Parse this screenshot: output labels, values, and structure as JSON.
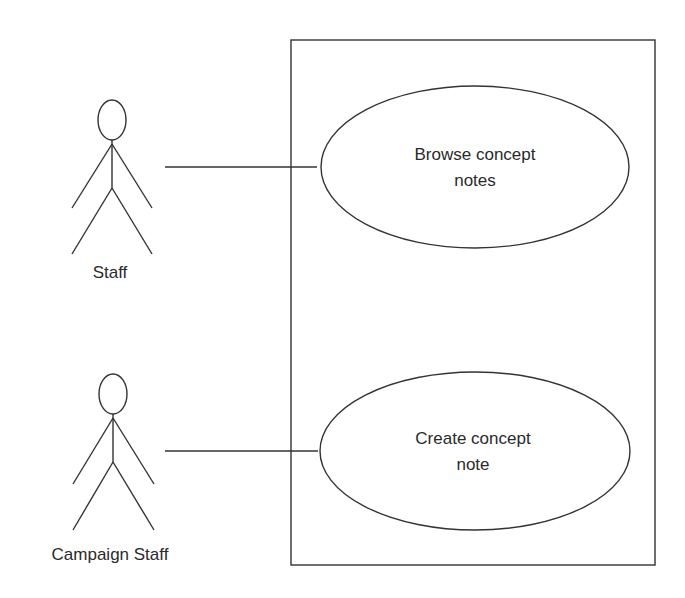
{
  "diagram": {
    "type": "uml-use-case",
    "system_boundary": {
      "label": ""
    },
    "actors": [
      {
        "id": "staff",
        "label": "Staff"
      },
      {
        "id": "campaign-staff",
        "label": "Campaign Staff"
      }
    ],
    "use_cases": [
      {
        "id": "browse",
        "line1": "Browse concept",
        "line2": "notes"
      },
      {
        "id": "create",
        "line1": "Create concept",
        "line2": "note"
      }
    ],
    "associations": [
      {
        "from": "staff",
        "to": "browse"
      },
      {
        "from": "campaign-staff",
        "to": "create"
      }
    ],
    "colors": {
      "line": "#333333",
      "text": "#2a2a2a",
      "background": "#ffffff"
    }
  }
}
